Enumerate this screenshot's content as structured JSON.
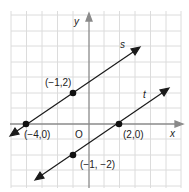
{
  "diagram": {
    "axes": {
      "x_label": "x",
      "y_label": "y",
      "origin_label": "O"
    },
    "lines": [
      {
        "name": "s",
        "points": [
          [
            -4,
            0
          ],
          [
            -1,
            2
          ]
        ]
      },
      {
        "name": "t",
        "points": [
          [
            2,
            0
          ],
          [
            -1,
            -2
          ]
        ]
      }
    ],
    "point_labels": {
      "p1": "(−1,2)",
      "p2": "(−4,0)",
      "p3": "(2,0)",
      "p4": "(−1, −2)"
    },
    "colors": {
      "grid": "#dddddd",
      "axis": "#888888",
      "line": "#1a1a1a"
    }
  }
}
